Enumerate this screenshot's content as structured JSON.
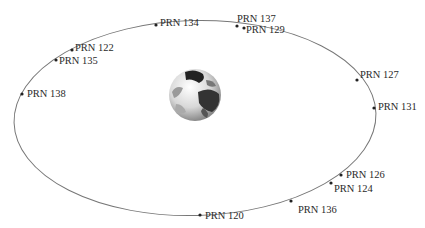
{
  "diagram": {
    "type": "satellite-orbit",
    "center_body": "earth-globe",
    "orbit_color": "#777777",
    "satellites": [
      {
        "id": "prn134",
        "label": "PRN 134",
        "x": 156,
        "y": 25,
        "lx": 160,
        "ly": 18
      },
      {
        "id": "prn137",
        "label": "PRN 137",
        "x": 237,
        "y": 26,
        "lx": 237,
        "ly": 14
      },
      {
        "id": "prn129",
        "label": "PRN 129",
        "x": 244,
        "y": 28,
        "lx": 246,
        "ly": 25
      },
      {
        "id": "prn122",
        "label": "PRN 122",
        "x": 72,
        "y": 50,
        "lx": 75,
        "ly": 43
      },
      {
        "id": "prn135",
        "label": "PRN 135",
        "x": 56,
        "y": 60,
        "lx": 59,
        "ly": 56
      },
      {
        "id": "prn138",
        "label": "PRN 138",
        "x": 22,
        "y": 94,
        "lx": 27,
        "ly": 89
      },
      {
        "id": "prn127",
        "label": "PRN 127",
        "x": 357,
        "y": 80,
        "lx": 360,
        "ly": 70
      },
      {
        "id": "prn131",
        "label": "PRN 131",
        "x": 374,
        "y": 108,
        "lx": 378,
        "ly": 102
      },
      {
        "id": "prn126",
        "label": "PRN 126",
        "x": 341,
        "y": 175,
        "lx": 346,
        "ly": 170
      },
      {
        "id": "prn124",
        "label": "PRN 124",
        "x": 331,
        "y": 183,
        "lx": 334,
        "ly": 184
      },
      {
        "id": "prn136",
        "label": "PRN 136",
        "x": 291,
        "y": 201,
        "lx": 298,
        "ly": 205
      },
      {
        "id": "prn120",
        "label": "PRN 120",
        "x": 200,
        "y": 215,
        "lx": 205,
        "ly": 211
      }
    ]
  }
}
